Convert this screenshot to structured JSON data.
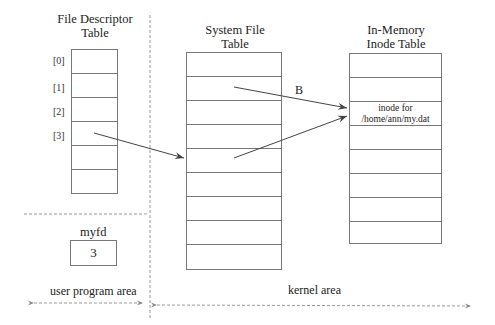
{
  "fd_table": {
    "title_line1": "File Descriptor",
    "title_line2": "Table",
    "indices": [
      "[0]",
      "[1]",
      "[2]",
      "[3]"
    ],
    "rows": [
      "",
      "",
      "",
      "",
      "",
      ""
    ]
  },
  "system_table": {
    "title_line1": "System File",
    "title_line2": "Table",
    "rows": [
      "",
      "",
      "",
      "",
      "",
      "",
      "",
      "",
      ""
    ]
  },
  "inode_table": {
    "title_line1": "In-Memory",
    "title_line2": "Inode Table",
    "rows": [
      "",
      "",
      "inode for\n/home/ann/my.dat",
      "",
      "",
      "",
      "",
      ""
    ],
    "entry_line1": "inode for",
    "entry_line2": "/home/ann/my.dat"
  },
  "variable": {
    "name": "myfd",
    "value": "3"
  },
  "arrows": {
    "label_b": "B"
  },
  "areas": {
    "user": "user program area",
    "kernel": "kernel area"
  },
  "colors": {
    "line": "#777777",
    "arrow": "#444444",
    "dashed": "#999999"
  }
}
